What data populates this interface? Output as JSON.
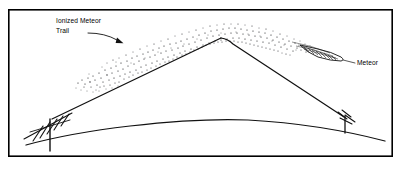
{
  "figure": {
    "type": "technical-diagram",
    "background_color": "#ffffff",
    "ink_color": "#111111",
    "frame": {
      "name": "figure-border",
      "x": 8,
      "y": 9,
      "width": 385,
      "height": 148
    },
    "labels": {
      "ionized_trail_line1": "Ionized Meteor",
      "ionized_trail_line2": "Trail",
      "meteor": "Meteor"
    },
    "annotations": {
      "trail_arrow": {
        "name": "ionized-trail-pointer-arrow",
        "description": "curved arrow from label to ionized dot band"
      },
      "meteor_leader": {
        "name": "meteor-leader-line",
        "description": "short leader from meteor body to Meteor label"
      }
    },
    "elements": {
      "earth_curve": "curved earth surface horizon",
      "ionized_trail": "stippled band of ionized particles",
      "meteor_body": "elongated pointed meteor with hatching",
      "signal_path": "radio signal path reflecting off the ionized trail",
      "left_antenna": "transmitting yagi antenna on mast",
      "right_antenna": "receiving antenna on mast"
    },
    "geometry": {
      "signal_apex": {
        "x": 220,
        "y": 38
      },
      "left_station": {
        "x": 50,
        "y": 121
      },
      "right_station": {
        "x": 345,
        "y": 119
      }
    }
  }
}
